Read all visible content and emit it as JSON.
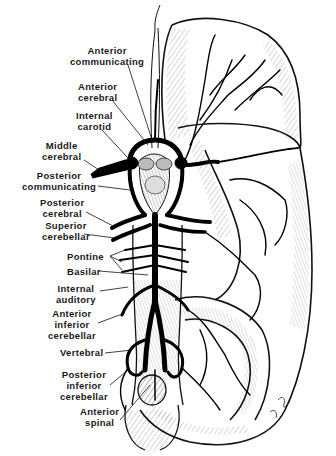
{
  "figure": {
    "ink_color": "#111111",
    "background": "#ffffff"
  },
  "labels": [
    {
      "id": "anterior-communicating",
      "lines": [
        "Anterior",
        "communicating"
      ],
      "x": 70,
      "y": 45
    },
    {
      "id": "anterior-cerebral",
      "lines": [
        "Anterior",
        "cerebral"
      ],
      "x": 78,
      "y": 81
    },
    {
      "id": "internal-carotid",
      "lines": [
        "Internal",
        "carotid"
      ],
      "x": 76,
      "y": 110
    },
    {
      "id": "middle-cerebral",
      "lines": [
        "Middle",
        "cerebral"
      ],
      "x": 42,
      "y": 140
    },
    {
      "id": "posterior-communicating",
      "lines": [
        "Posterior",
        "communicating"
      ],
      "x": 22,
      "y": 170
    },
    {
      "id": "posterior-cerebral",
      "lines": [
        "Posterior",
        "cerebral"
      ],
      "x": 40,
      "y": 197
    },
    {
      "id": "superior-cerebellar",
      "lines": [
        "Superior",
        "cerebellar"
      ],
      "x": 42,
      "y": 220
    },
    {
      "id": "pontine",
      "lines": [
        "Pontine"
      ],
      "x": 67,
      "y": 251
    },
    {
      "id": "basilar",
      "lines": [
        "Basilar"
      ],
      "x": 67,
      "y": 266
    },
    {
      "id": "internal-auditory",
      "lines": [
        "Internal",
        "auditory"
      ],
      "x": 56,
      "y": 283
    },
    {
      "id": "anterior-inferior-cerebellar",
      "lines": [
        "Anterior",
        "inferior",
        "cerebellar"
      ],
      "x": 48,
      "y": 308
    },
    {
      "id": "vertebral",
      "lines": [
        "Vertebral"
      ],
      "x": 60,
      "y": 347
    },
    {
      "id": "posterior-inferior-cerebellar",
      "lines": [
        "Posterior",
        "inferior",
        "cerebellar"
      ],
      "x": 60,
      "y": 369
    },
    {
      "id": "anterior-spinal",
      "lines": [
        "Anterior",
        "spinal"
      ],
      "x": 80,
      "y": 406
    }
  ]
}
